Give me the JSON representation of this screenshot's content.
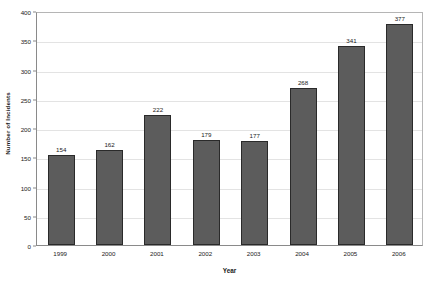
{
  "chart_data": {
    "type": "bar",
    "title": "",
    "xlabel": "Year",
    "ylabel": "Number of Incidents",
    "categories": [
      "1999",
      "2000",
      "2001",
      "2002",
      "2003",
      "2004",
      "2005",
      "2006"
    ],
    "values": [
      154,
      162,
      222,
      179,
      177,
      268,
      341,
      377
    ],
    "value_labels": [
      "154",
      "162",
      "222",
      "179",
      "177",
      "268",
      "341",
      "377"
    ],
    "ylim": [
      0,
      400
    ],
    "yticks": [
      0,
      50,
      100,
      150,
      200,
      250,
      300,
      350,
      400
    ],
    "ytick_labels": [
      "0",
      "50",
      "100",
      "150",
      "200",
      "250",
      "300",
      "350",
      "400"
    ],
    "grid": true,
    "grid_axis": "y",
    "legend": false,
    "legend_position": "none",
    "bar_color": "#5c5c5c",
    "bar_border_color": "#2a2a2a",
    "grid_color": "#e3e3e3",
    "axis_color": "#8a8a8a",
    "text_color": "#1a1a1a",
    "background_color": "#ffffff"
  }
}
